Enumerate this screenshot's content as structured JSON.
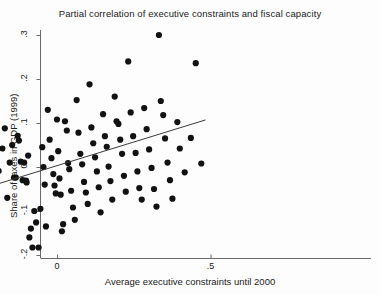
{
  "chart_data": {
    "type": "scatter",
    "title": "Partial correlation of executive constraints and fiscal capacity",
    "xlabel": "Average executive constraints until 2000",
    "ylabel": "Share of taxes in GDP (1999)",
    "xlim": [
      -0.55,
      0.55
    ],
    "ylim": [
      -0.23,
      0.32
    ],
    "xticks": [
      -0.5,
      0,
      0.5
    ],
    "xticklabels": [
      "-.5",
      "0",
      ".5"
    ],
    "yticks": [
      -0.2,
      -0.1,
      0,
      0.1,
      0.2,
      0.3
    ],
    "yticklabels": [
      "-.2",
      "-.1",
      "0",
      ".1",
      ".2",
      ".3"
    ],
    "grid": false,
    "legend": null,
    "marker": {
      "shape": "circle",
      "color": "#121212",
      "size": 3.1
    },
    "fit_line": {
      "label": "linear fit",
      "color": "#3a3a3a",
      "x": [
        -0.484,
        0.484
      ],
      "y": [
        -0.101,
        0.107
      ]
    },
    "points": [
      {
        "x": -0.484,
        "y": -0.073
      },
      {
        "x": -0.352,
        "y": -0.128
      },
      {
        "x": -0.323,
        "y": -0.198
      },
      {
        "x": -0.296,
        "y": -0.196
      },
      {
        "x": -0.276,
        "y": -0.143
      },
      {
        "x": -0.257,
        "y": -0.166
      },
      {
        "x": -0.249,
        "y": -0.114
      },
      {
        "x": -0.241,
        "y": -0.166
      },
      {
        "x": -0.23,
        "y": -0.165
      },
      {
        "x": -0.215,
        "y": -0.126
      },
      {
        "x": -0.202,
        "y": 0.031
      },
      {
        "x": -0.19,
        "y": -0.009
      },
      {
        "x": -0.178,
        "y": 0.042
      },
      {
        "x": -0.17,
        "y": 0.088
      },
      {
        "x": -0.162,
        "y": -0.07
      },
      {
        "x": -0.154,
        "y": 0.01
      },
      {
        "x": -0.146,
        "y": 0.05
      },
      {
        "x": -0.14,
        "y": -0.024
      },
      {
        "x": -0.134,
        "y": -0.024
      },
      {
        "x": -0.128,
        "y": 0.071
      },
      {
        "x": -0.124,
        "y": 0.06
      },
      {
        "x": -0.118,
        "y": 0.012
      },
      {
        "x": -0.112,
        "y": -0.03
      },
      {
        "x": -0.107,
        "y": 0.01
      },
      {
        "x": -0.101,
        "y": -0.031
      },
      {
        "x": -0.099,
        "y": -0.035
      },
      {
        "x": -0.094,
        "y": 0.026
      },
      {
        "x": -0.09,
        "y": -0.16
      },
      {
        "x": -0.085,
        "y": -0.14
      },
      {
        "x": -0.08,
        "y": -0.183
      },
      {
        "x": -0.074,
        "y": -0.1
      },
      {
        "x": -0.068,
        "y": -0.126
      },
      {
        "x": -0.06,
        "y": -0.183
      },
      {
        "x": -0.054,
        "y": -0.095
      },
      {
        "x": -0.048,
        "y": 0.045
      },
      {
        "x": -0.044,
        "y": 0.0
      },
      {
        "x": -0.04,
        "y": -0.04
      },
      {
        "x": -0.036,
        "y": -0.135
      },
      {
        "x": -0.03,
        "y": 0.13
      },
      {
        "x": -0.024,
        "y": 0.062
      },
      {
        "x": -0.018,
        "y": 0.02
      },
      {
        "x": -0.012,
        "y": -0.016
      },
      {
        "x": -0.008,
        "y": -0.042
      },
      {
        "x": -0.004,
        "y": -0.06
      },
      {
        "x": 0.0,
        "y": 0.108
      },
      {
        "x": 0.004,
        "y": 0.036
      },
      {
        "x": 0.008,
        "y": -0.026
      },
      {
        "x": 0.012,
        "y": -0.063
      },
      {
        "x": 0.016,
        "y": -0.146
      },
      {
        "x": 0.02,
        "y": -0.13
      },
      {
        "x": 0.026,
        "y": 0.104
      },
      {
        "x": 0.032,
        "y": 0.083
      },
      {
        "x": 0.036,
        "y": 0.009
      },
      {
        "x": 0.04,
        "y": -0.005
      },
      {
        "x": 0.046,
        "y": -0.054
      },
      {
        "x": 0.052,
        "y": -0.092
      },
      {
        "x": 0.058,
        "y": -0.12
      },
      {
        "x": 0.064,
        "y": 0.152
      },
      {
        "x": 0.07,
        "y": 0.078
      },
      {
        "x": 0.076,
        "y": 0.03
      },
      {
        "x": 0.082,
        "y": 0.006
      },
      {
        "x": 0.088,
        "y": -0.034
      },
      {
        "x": 0.094,
        "y": -0.058
      },
      {
        "x": 0.1,
        "y": -0.084
      },
      {
        "x": 0.106,
        "y": 0.188
      },
      {
        "x": 0.112,
        "y": 0.09
      },
      {
        "x": 0.118,
        "y": 0.054
      },
      {
        "x": 0.124,
        "y": 0.022
      },
      {
        "x": 0.13,
        "y": -0.01
      },
      {
        "x": 0.136,
        "y": -0.046
      },
      {
        "x": 0.142,
        "y": -0.103
      },
      {
        "x": 0.15,
        "y": 0.12
      },
      {
        "x": 0.156,
        "y": 0.07
      },
      {
        "x": 0.162,
        "y": 0.046
      },
      {
        "x": 0.168,
        "y": 0.001
      },
      {
        "x": 0.174,
        "y": -0.032
      },
      {
        "x": 0.18,
        "y": -0.074
      },
      {
        "x": 0.188,
        "y": 0.16
      },
      {
        "x": 0.194,
        "y": 0.104
      },
      {
        "x": 0.2,
        "y": 0.098
      },
      {
        "x": 0.206,
        "y": 0.062
      },
      {
        "x": 0.212,
        "y": 0.03
      },
      {
        "x": 0.218,
        "y": -0.02
      },
      {
        "x": 0.224,
        "y": -0.056
      },
      {
        "x": 0.232,
        "y": 0.24
      },
      {
        "x": 0.24,
        "y": 0.124
      },
      {
        "x": 0.248,
        "y": 0.07
      },
      {
        "x": 0.256,
        "y": 0.032
      },
      {
        "x": 0.262,
        "y": -0.01
      },
      {
        "x": 0.268,
        "y": -0.048
      },
      {
        "x": 0.276,
        "y": -0.074
      },
      {
        "x": 0.284,
        "y": 0.134
      },
      {
        "x": 0.292,
        "y": 0.086
      },
      {
        "x": 0.3,
        "y": 0.04
      },
      {
        "x": 0.308,
        "y": -0.002
      },
      {
        "x": 0.316,
        "y": -0.05
      },
      {
        "x": 0.324,
        "y": -0.09
      },
      {
        "x": 0.332,
        "y": 0.3
      },
      {
        "x": 0.338,
        "y": 0.15
      },
      {
        "x": 0.346,
        "y": 0.118
      },
      {
        "x": 0.352,
        "y": 0.065
      },
      {
        "x": 0.36,
        "y": 0.01
      },
      {
        "x": 0.368,
        "y": -0.03
      },
      {
        "x": 0.376,
        "y": -0.072
      },
      {
        "x": 0.392,
        "y": 0.102
      },
      {
        "x": 0.4,
        "y": 0.042
      },
      {
        "x": 0.416,
        "y": -0.012
      },
      {
        "x": 0.436,
        "y": 0.066
      },
      {
        "x": 0.452,
        "y": 0.236
      },
      {
        "x": 0.47,
        "y": 0.008
      }
    ]
  }
}
